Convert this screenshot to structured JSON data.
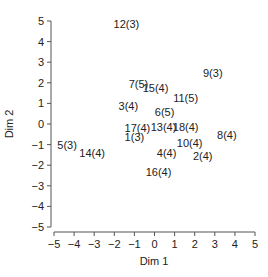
{
  "chart_data": {
    "type": "scatter",
    "title": "",
    "xlabel": "Dim 1",
    "ylabel": "Dim 2",
    "xlim": [
      -5,
      5
    ],
    "ylim": [
      -5,
      5
    ],
    "xticks": [
      -5,
      -4,
      -3,
      -2,
      -1,
      0,
      1,
      2,
      3,
      4,
      5
    ],
    "yticks": [
      5,
      4,
      3,
      2,
      1,
      0,
      -1,
      -2,
      -3,
      -4,
      -5
    ],
    "grid": false,
    "legend": null,
    "marker": "text-label",
    "points": [
      {
        "label": "12(3)",
        "x": -1.4,
        "y": 4.85
      },
      {
        "label": "9(3)",
        "x": 2.9,
        "y": 2.5
      },
      {
        "label": "7(5)",
        "x": -0.8,
        "y": 1.95
      },
      {
        "label": "15(4)",
        "x": 0.05,
        "y": 1.75
      },
      {
        "label": "11(5)",
        "x": 1.55,
        "y": 1.25
      },
      {
        "label": "3(4)",
        "x": -1.3,
        "y": 0.85
      },
      {
        "label": "6(5)",
        "x": 0.5,
        "y": 0.6
      },
      {
        "label": "17(4)",
        "x": -0.85,
        "y": -0.2
      },
      {
        "label": "13(4)",
        "x": 0.45,
        "y": -0.15
      },
      {
        "label": "18(4)",
        "x": 1.55,
        "y": -0.15
      },
      {
        "label": "1(3)",
        "x": -1.0,
        "y": -0.65
      },
      {
        "label": "8(4)",
        "x": 3.6,
        "y": -0.55
      },
      {
        "label": "10(4)",
        "x": 1.75,
        "y": -0.9
      },
      {
        "label": "5(3)",
        "x": -4.35,
        "y": -1.0
      },
      {
        "label": "14(4)",
        "x": -3.1,
        "y": -1.4
      },
      {
        "label": "4(4)",
        "x": 0.6,
        "y": -1.4
      },
      {
        "label": "2(4)",
        "x": 2.4,
        "y": -1.55
      },
      {
        "label": "16(4)",
        "x": 0.2,
        "y": -2.35
      }
    ]
  },
  "colors": {
    "axis": "#555555",
    "text": "#222222",
    "background": "#ffffff"
  }
}
